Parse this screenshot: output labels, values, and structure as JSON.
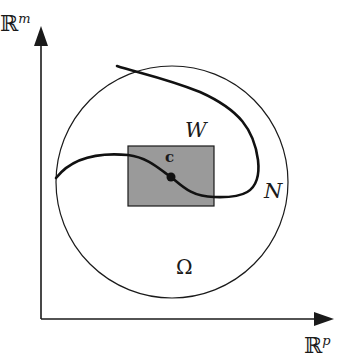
{
  "diagram": {
    "axes": {
      "vertical_label": "ℝ",
      "vertical_superscript": "m",
      "horizontal_label": "ℝ",
      "horizontal_superscript": "p"
    },
    "region_label": "Ω",
    "manifold_label": "N",
    "neighborhood_label": "W",
    "point_label": "c",
    "colors": {
      "stroke": "#1a1a1a",
      "box_fill": "#9a9a9a",
      "background": "#ffffff"
    }
  }
}
